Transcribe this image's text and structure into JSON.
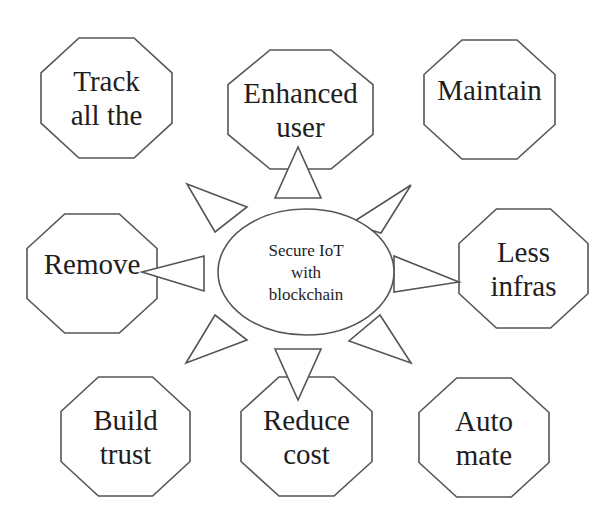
{
  "diagram": {
    "type": "radial-concept-diagram",
    "center": {
      "lines": [
        "Secure IoT",
        "with",
        "blockchain"
      ],
      "shape": "ellipse",
      "cx": 306,
      "cy": 272,
      "rx": 88,
      "ry": 63
    },
    "nodes": [
      {
        "id": "track",
        "lines": [
          "Track",
          "all the"
        ],
        "x": 41,
        "y": 38,
        "w": 131,
        "h": 120
      },
      {
        "id": "enhanced-user",
        "lines": [
          "Enhanced",
          "user"
        ],
        "x": 228,
        "y": 50,
        "w": 145,
        "h": 119
      },
      {
        "id": "maintain",
        "lines": [
          "Maintain"
        ],
        "x": 424,
        "y": 40,
        "w": 131,
        "h": 119
      },
      {
        "id": "remove",
        "lines": [
          "Remove"
        ],
        "x": 27,
        "y": 214,
        "w": 130,
        "h": 119
      },
      {
        "id": "less-infras",
        "lines": [
          "Less",
          "infras"
        ],
        "x": 459,
        "y": 209,
        "w": 129,
        "h": 119
      },
      {
        "id": "build-trust",
        "lines": [
          "Build",
          "trust"
        ],
        "x": 61,
        "y": 377,
        "w": 129,
        "h": 119
      },
      {
        "id": "reduce-cost",
        "lines": [
          "Reduce",
          "cost"
        ],
        "x": 241,
        "y": 377,
        "w": 131,
        "h": 119
      },
      {
        "id": "automate",
        "lines": [
          "Auto",
          "mate"
        ],
        "x": 419,
        "y": 378,
        "w": 130,
        "h": 119
      }
    ],
    "arrows": [
      {
        "id": "arrow-up",
        "points": "298,147 275,198 321,198"
      },
      {
        "id": "arrow-up-left",
        "points": "187,184 247,207 215,232"
      },
      {
        "id": "arrow-up-right",
        "points": "411,185 350,224 381,233"
      },
      {
        "id": "arrow-left",
        "points": "142,272 204,256 204,291"
      },
      {
        "id": "arrow-right",
        "points": "459,282 394,256 394,292"
      },
      {
        "id": "arrow-down-left",
        "points": "186,363 215,315 247,340"
      },
      {
        "id": "arrow-down-right",
        "points": "411,363 380,315 349,341"
      },
      {
        "id": "arrow-down",
        "points": "298,400 275,349 321,349"
      }
    ],
    "colors": {
      "stroke": "#555555",
      "fill": "#ffffff",
      "text": "#1e1e1e",
      "background": "#ffffff"
    }
  }
}
